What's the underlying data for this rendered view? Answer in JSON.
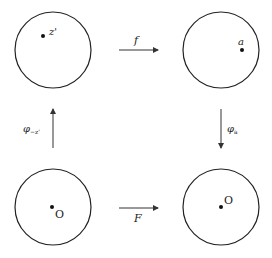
{
  "diagram": {
    "type": "commutative-diagram",
    "nodes": [
      {
        "id": "top-left",
        "shape": "circle",
        "point_label": "z'"
      },
      {
        "id": "top-right",
        "shape": "circle",
        "point_label": "a"
      },
      {
        "id": "bottom-left",
        "shape": "circle",
        "point_label": "O"
      },
      {
        "id": "bottom-right",
        "shape": "circle",
        "point_label": "O"
      }
    ],
    "edges": [
      {
        "from": "top-left",
        "to": "top-right",
        "label": "f"
      },
      {
        "from": "top-right",
        "to": "bottom-right",
        "label": "φ",
        "subscript": "a"
      },
      {
        "from": "bottom-left",
        "to": "top-left",
        "label": "φ",
        "subscript": "−z'"
      },
      {
        "from": "bottom-left",
        "to": "bottom-right",
        "label": "F"
      }
    ]
  }
}
